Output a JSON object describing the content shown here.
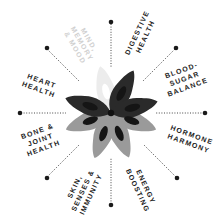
{
  "diagram": {
    "center": {
      "x": 111,
      "y": 113
    },
    "colors": {
      "dark": "#2a2a2a",
      "grey": "#9a9a9a",
      "light": "#ececec",
      "seed": "#151515",
      "dot": "#1a1a1a",
      "text": "#222222",
      "faint_text": "#cfcfcf"
    },
    "spokes": [
      {
        "id": "mind",
        "lines": [
          "MIND,",
          "MEMORY",
          "& MOOD"
        ],
        "faint": true
      },
      {
        "id": "digestive",
        "lines": [
          "DIGESTIVE",
          "HEALTH"
        ]
      },
      {
        "id": "blood-sugar",
        "lines": [
          "BLOOD-",
          "SUGAR",
          "BALANCE"
        ]
      },
      {
        "id": "hormone",
        "lines": [
          "HORMONE",
          "HARMONY"
        ]
      },
      {
        "id": "energy",
        "lines": [
          "ENERGY",
          "BOOSTING"
        ]
      },
      {
        "id": "skin",
        "lines": [
          "SKIN,",
          "SENSES &",
          "IMMUNITY"
        ]
      },
      {
        "id": "bone",
        "lines": [
          "BONE &",
          "JOINT",
          "HEALTH"
        ]
      },
      {
        "id": "heart",
        "lines": [
          "HEART",
          "HEALTH"
        ]
      }
    ]
  }
}
